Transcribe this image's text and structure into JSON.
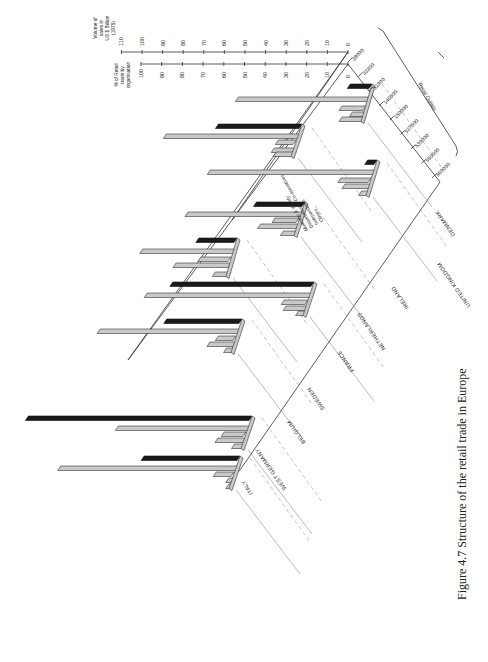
{
  "figure": {
    "caption": "Figure 4.7    Structure of the retail trade in Europe"
  },
  "axes": {
    "volume_title": [
      "Volume of",
      "sales in",
      "US $ Billion",
      "(1975)"
    ],
    "volume_ticks": [
      "0",
      "10",
      "20",
      "30",
      "40",
      "50",
      "60",
      "70",
      "80",
      "90",
      "100",
      "110"
    ],
    "percent_title": [
      "% of Retail",
      "trade by",
      "organisation"
    ],
    "percent_ticks": [
      "0",
      "10",
      "20",
      "30",
      "40",
      "50",
      "60",
      "70",
      "80",
      "90",
      "100"
    ],
    "outlets_title": "Retail Outlets",
    "outlet_ticks": [
      "28000",
      "33300",
      "51900",
      "146000",
      "150000",
      "527000",
      "530000",
      "550000",
      "960000"
    ]
  },
  "legend": {
    "items": [
      "Multiples & Variety",
      "Department & Co-operatives",
      "Independents",
      "Others"
    ]
  },
  "countries": [
    "DENMARK",
    "UNITED KINGDOM",
    "IRELAND",
    "NETHERLANDS",
    "FRANCE",
    "SWEDEN",
    "BELGIUM",
    "WEST GERMANY",
    "ITALY"
  ],
  "chart_data": {
    "type": "bar",
    "title": "Structure of the retail trade in Europe",
    "subtitle": "Figure 4.7",
    "orientation": "rotated 90deg (3D perspective bar chart)",
    "categories": [
      "Denmark",
      "United Kingdom",
      "Ireland",
      "Netherlands",
      "France",
      "Sweden",
      "Belgium",
      "West Germany",
      "Italy"
    ],
    "series": [
      {
        "name": "Volume of sales (US $ Billion, 1975)",
        "color": "#1a1a1a",
        "values": [
          12,
          42,
          6,
          25,
          70,
          20,
          38,
          110,
          48
        ]
      },
      {
        "name": "Independents (% of retail trade)",
        "color": "#c9c9c9",
        "values": [
          66,
          67,
          82,
          58,
          82,
          47,
          70,
          66,
          88
        ]
      },
      {
        "name": "Department & Co-operatives (% of retail trade)",
        "color": "#c9c9c9",
        "values": [
          13,
          10,
          16,
          13,
          13,
          16,
          10,
          12,
          10
        ]
      },
      {
        "name": "Multiples & Variety (% of retail trade)",
        "color": "#c9c9c9",
        "values": [
          8,
          12,
          14,
          20,
          12,
          28,
          14,
          15,
          4
        ]
      },
      {
        "name": "Others (% of retail trade)",
        "color": "#c9c9c9",
        "values": [
          13,
          11,
          6,
          9,
          6,
          9,
          6,
          7,
          4
        ]
      }
    ],
    "retail_outlets": {
      "Denmark": 28000,
      "Ireland": 33300,
      "Sweden": 51900,
      "Netherlands": 146000,
      "Belgium": 150000,
      "United Kingdom": 527000,
      "France": 530000,
      "West Germany": 550000,
      "Italy": 960000
    },
    "xlabel": "Country",
    "ylabel_left": "% of Retail trade by organisation",
    "ylabel_right": "Volume of sales in US $ Billion (1975)",
    "ylim_percent": [
      0,
      100
    ],
    "ylim_volume": [
      0,
      110
    ],
    "grid": true,
    "legend_position": "inline, diagonal near Ireland/Netherlands"
  }
}
